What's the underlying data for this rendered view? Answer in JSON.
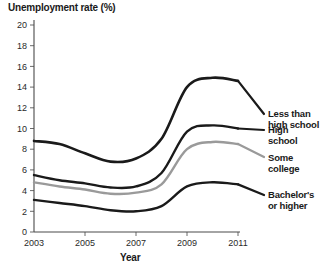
{
  "chart_data": {
    "type": "line",
    "title": "Unemployment rate (%)",
    "xlabel": "Year",
    "ylabel": "Unemployment rate (%)",
    "xlim": [
      2003,
      2011
    ],
    "ylim": [
      0,
      20
    ],
    "grid": false,
    "legend_position": "right-inline",
    "x_ticks": [
      "2003",
      "2005",
      "2007",
      "2009",
      "2011"
    ],
    "x_tick_values": [
      2003,
      2005,
      2007,
      2009,
      2011
    ],
    "y_ticks": [
      "0",
      "2",
      "4",
      "6",
      "8",
      "10",
      "12",
      "14",
      "16",
      "18",
      "20"
    ],
    "y_tick_values": [
      0,
      2,
      4,
      6,
      8,
      10,
      12,
      14,
      16,
      18,
      20
    ],
    "x": [
      2003,
      2004,
      2005,
      2006,
      2007,
      2008,
      2009,
      2010,
      2011
    ],
    "series": [
      {
        "name": "Less than high school",
        "color": "#1a1a1a",
        "width": 2.6,
        "values": [
          8.8,
          8.5,
          7.6,
          6.8,
          7.1,
          9.0,
          14.0,
          14.9,
          14.6
        ]
      },
      {
        "name": "High school",
        "color": "#1a1a1a",
        "width": 2.4,
        "values": [
          5.5,
          5.0,
          4.7,
          4.3,
          4.4,
          5.7,
          9.7,
          10.3,
          10.0
        ]
      },
      {
        "name": "Some college",
        "color": "#9a9a9a",
        "width": 2.4,
        "values": [
          4.8,
          4.4,
          4.1,
          3.7,
          3.8,
          4.6,
          8.0,
          8.7,
          8.5
        ]
      },
      {
        "name": "Bachelor's or higher",
        "color": "#1a1a1a",
        "width": 2.4,
        "values": [
          3.1,
          2.8,
          2.5,
          2.1,
          2.0,
          2.5,
          4.4,
          4.8,
          4.6
        ]
      }
    ]
  },
  "legend": {
    "items": [
      {
        "line1": "Less than",
        "line2": "high school"
      },
      {
        "line1": "High",
        "line2": "school"
      },
      {
        "line1": "Some",
        "line2": "college"
      },
      {
        "line1": "Bachelor's",
        "line2": "or higher"
      }
    ]
  }
}
